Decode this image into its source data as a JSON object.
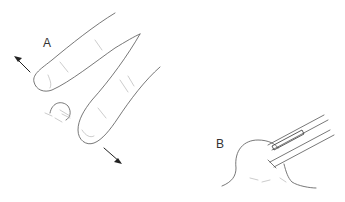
{
  "figure": {
    "panels": [
      {
        "label": "A",
        "description": "Two fingers pressing on either side of a small nodule, arrows showing outward pulling direction"
      },
      {
        "label": "B",
        "description": "Forceps grasping a rounded nodule on skin surface"
      }
    ]
  }
}
